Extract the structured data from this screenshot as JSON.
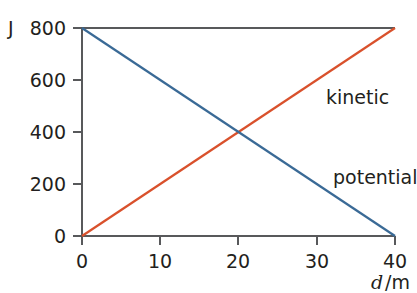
{
  "chart_data": {
    "type": "line",
    "title": "",
    "xlabel": "d/m",
    "xlabel_symbol": "d",
    "xlabel_unit": "/m",
    "ylabel": "J",
    "xlim": [
      0,
      40
    ],
    "ylim": [
      0,
      800
    ],
    "grid": false,
    "legend_position": "inline-right",
    "x_ticks": [
      0,
      10,
      20,
      30,
      40
    ],
    "x_tick_labels": [
      "0",
      "10",
      "20",
      "30",
      "40"
    ],
    "y_ticks": [
      0,
      200,
      400,
      600,
      800
    ],
    "y_tick_labels": [
      "0",
      "200",
      "400",
      "600",
      "800"
    ],
    "series": [
      {
        "name": "kinetic",
        "color": "#d9512c",
        "x": [
          0,
          40
        ],
        "values": [
          0,
          800
        ]
      },
      {
        "name": "potential",
        "color": "#3a6a96",
        "x": [
          0,
          40
        ],
        "values": [
          800,
          0
        ]
      }
    ],
    "annotations": [
      {
        "text": "kinetic",
        "x": 37,
        "y": 560
      },
      {
        "text": "potential",
        "x": 37,
        "y": 250
      }
    ],
    "intersection": {
      "x": 20,
      "y": 400
    }
  },
  "labels": {
    "y_unit": "J",
    "x_axis_symbol": "d",
    "x_axis_unit": "/m",
    "series_kinetic": "kinetic",
    "series_potential": "potential",
    "y_800": "800",
    "y_600": "600",
    "y_400": "400",
    "y_200": "200",
    "y_0": "0",
    "x_0": "0",
    "x_10": "10",
    "x_20": "20",
    "x_30": "30",
    "x_40": "40"
  },
  "colors": {
    "kinetic": "#d9512c",
    "potential": "#3a6a96",
    "axis": "#58595b",
    "text": "#231f20",
    "background": "#ffffff"
  }
}
